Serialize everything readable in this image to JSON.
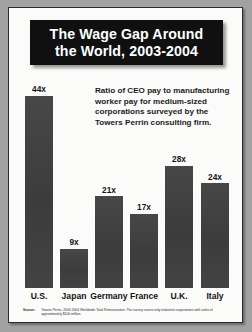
{
  "poster": {
    "title_lines": [
      "The Wage Gap Around",
      "the World, 2003-2004"
    ],
    "caption": "Ratio of CEO pay to manufacturing worker pay for medium-sized corporations surveyed by the Towers Perrin consulting firm.",
    "source_tag": "Source:",
    "source_text": "Towers Perrin, 2003-2004 Worldwide Total Remuneration. The survey covers only industrial corporations with sales of approximately $500 million.",
    "colors": {
      "bar": "#414141",
      "banner_background": "#101010",
      "banner_text": "#ffffff",
      "sheet": "#fbfbfa",
      "frame_border": "#2b2b2b",
      "backdrop": "#a2a2a2"
    }
  },
  "chart_data": {
    "type": "bar",
    "title": "The Wage Gap Around the World, 2003-2004",
    "subtitle": "Ratio of CEO pay to manufacturing worker pay for medium-sized corporations surveyed by the Towers Perrin consulting firm.",
    "categories": [
      "U.S.",
      "Japan",
      "Germany",
      "France",
      "U.K.",
      "Italy"
    ],
    "values": [
      44,
      9,
      21,
      17,
      28,
      24
    ],
    "value_labels": [
      "44x",
      "9x",
      "21x",
      "17x",
      "28x",
      "24x"
    ],
    "xlabel": "",
    "ylabel": "",
    "ylim": [
      0,
      48
    ],
    "grid": false,
    "legend": "none"
  }
}
